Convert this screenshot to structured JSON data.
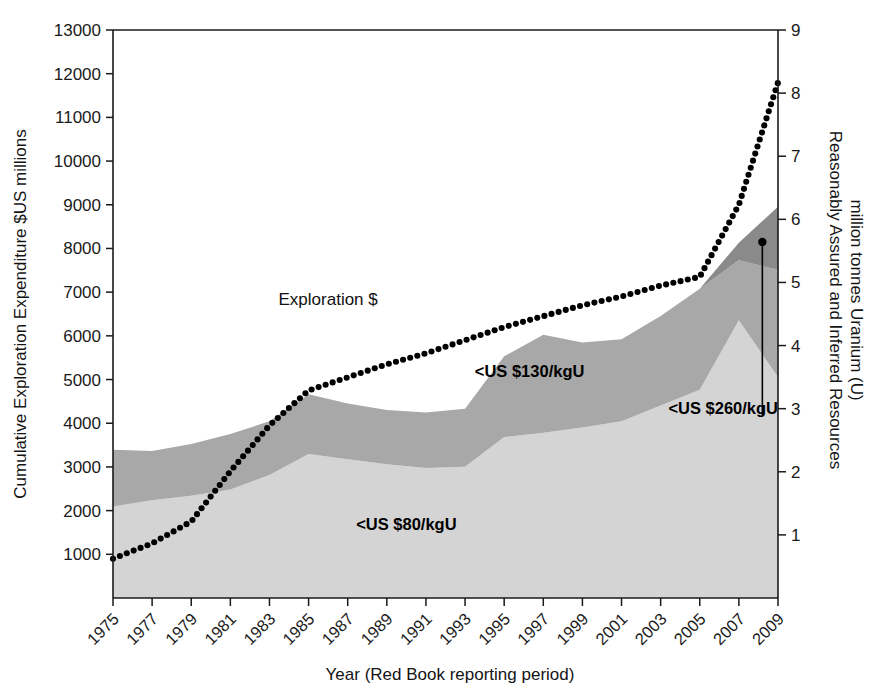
{
  "chart_data": {
    "type": "area",
    "title": "",
    "subtitle": "",
    "xlabel": "Year (Red Book reporting period)",
    "ylabel": "Cumulative Exploration Expenditure $US millions",
    "y2label": "Reasonably Assured and Inferred Resources million tonnes Uranium (U)",
    "grid": false,
    "legend_position": "inline-annotations",
    "xlim": [
      1975,
      2009
    ],
    "ylim": [
      0,
      13000
    ],
    "y2lim": [
      0,
      9
    ],
    "xticks": [
      1975,
      1977,
      1979,
      1981,
      1983,
      1985,
      1987,
      1989,
      1991,
      1993,
      1995,
      1997,
      1999,
      2001,
      2003,
      2005,
      2007,
      2009
    ],
    "xticklabels": [
      "1975",
      "1977",
      "1979",
      "1981",
      "1983",
      "1985",
      "1987",
      "1989",
      "1991",
      "1993",
      "1995",
      "1997",
      "1999",
      "2001",
      "2003",
      "2005",
      "2007",
      "2009"
    ],
    "yticks": [
      1000,
      2000,
      3000,
      4000,
      5000,
      6000,
      7000,
      8000,
      9000,
      10000,
      11000,
      12000,
      13000
    ],
    "yticklabels": [
      "1000",
      "2000",
      "3000",
      "4000",
      "5000",
      "6000",
      "7000",
      "8000",
      "9000",
      "10000",
      "11000",
      "12000",
      "13000"
    ],
    "y2ticks": [
      1,
      2,
      3,
      4,
      5,
      6,
      7,
      8,
      9
    ],
    "y2ticklabels": [
      "1",
      "2",
      "3",
      "4",
      "5",
      "6",
      "7",
      "8",
      "9"
    ],
    "x": [
      1975,
      1977,
      1979,
      1981,
      1983,
      1985,
      1987,
      1989,
      1991,
      1993,
      1995,
      1997,
      1999,
      2001,
      2003,
      2005,
      2007,
      2009
    ],
    "series": [
      {
        "name": "<US $80/kgU",
        "axis": "right",
        "units": "million tonnes U",
        "stack": "resources",
        "color": "#d4d4d4",
        "values": [
          1.45,
          1.55,
          1.62,
          1.72,
          1.95,
          2.28,
          2.2,
          2.12,
          2.06,
          2.08,
          2.55,
          2.62,
          2.7,
          2.8,
          3.05,
          3.3,
          4.4,
          3.5
        ]
      },
      {
        "name": "<US $130/kgU",
        "axis": "right",
        "units": "million tonnes U",
        "stack": "resources",
        "color": "#a8a8a8",
        "values": [
          0.9,
          0.78,
          0.82,
          0.88,
          0.85,
          0.95,
          0.88,
          0.86,
          0.88,
          0.92,
          1.28,
          1.55,
          1.35,
          1.3,
          1.42,
          1.6,
          0.95,
          1.7
        ]
      },
      {
        "name": "<US $260/kgU",
        "axis": "right",
        "units": "million tonnes U",
        "stack": "resources",
        "color": "#8a8a8a",
        "values": [
          0.0,
          0.0,
          0.0,
          0.0,
          0.0,
          0.0,
          0.0,
          0.0,
          0.0,
          0.0,
          0.0,
          0.0,
          0.0,
          0.0,
          0.0,
          0.0,
          0.28,
          1.0
        ]
      },
      {
        "name": "Exploration $",
        "axis": "left",
        "units": "$US millions",
        "style": "dotted",
        "color": "#000000",
        "values": [
          900,
          1250,
          1750,
          2900,
          3950,
          4750,
          5050,
          5350,
          5600,
          5900,
          6200,
          6450,
          6700,
          6900,
          7150,
          7350,
          9000,
          11800
        ]
      }
    ],
    "annotations": [
      {
        "text": "Exploration $",
        "x": 1986.0,
        "y": 6700,
        "bold": false
      },
      {
        "text": "<US $130/kgU",
        "x": 1996.3,
        "y": 5050,
        "bold": true
      },
      {
        "text": "<US $260/kgU",
        "x": 2006.2,
        "y": 4200,
        "bold": true
      },
      {
        "text": "<US $80/kgU",
        "x": 1990.0,
        "y": 1550,
        "bold": true
      }
    ],
    "callout": {
      "label": "<US $260/kgU",
      "from_x": 2008.2,
      "from_y": 4180,
      "to_x": 2008.2,
      "to_y": 8150,
      "marker": "dot"
    }
  },
  "colors": {
    "background": "#ffffff",
    "axis": "#1a1a1a",
    "text": "#141414",
    "band_80": "#d4d4d4",
    "band_130": "#a8a8a8",
    "band_260": "#8a8a8a",
    "exploration_line": "#000000"
  }
}
